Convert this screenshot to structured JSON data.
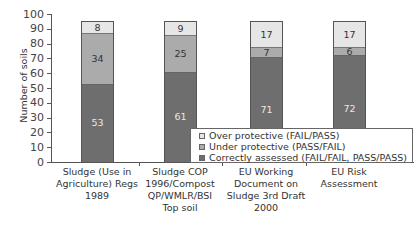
{
  "chart_data": {
    "type": "bar",
    "stacked": true,
    "title": "",
    "xlabel": "",
    "ylabel": "Number of soils",
    "ylim": [
      0,
      100
    ],
    "yticks": [
      0,
      10,
      20,
      30,
      40,
      50,
      60,
      70,
      80,
      90,
      100
    ],
    "grid": false,
    "legend_position": "lower right (inside)",
    "categories": [
      "Sludge (Use in Agriculture) Regs 1989",
      "Sludge COP 1996/Compost QP/WMLR/BSI Top soil",
      "EU Working Document on Sludge 3rd Draft 2000",
      "EU Risk Assessment"
    ],
    "category_lines": [
      [
        "Sludge (Use in",
        "Agriculture) Regs",
        "1989"
      ],
      [
        "Sludge COP",
        "1996/Compost",
        "QP/WMLR/BSI",
        "Top soil"
      ],
      [
        "EU Working",
        "Document on",
        "Sludge 3rd Draft",
        "2000"
      ],
      [
        "EU Risk",
        "Assessment"
      ]
    ],
    "series": [
      {
        "name": "Correctly assessed (FAIL/FAIL, PASS/PASS)",
        "color": "#6e6e6e",
        "values": [
          53,
          61,
          71,
          72
        ]
      },
      {
        "name": "Under protective (PASS/FAIL)",
        "color": "#ababab",
        "values": [
          34,
          25,
          7,
          6
        ]
      },
      {
        "name": "Over protective (FAIL/PASS)",
        "color": "#e6e6e6",
        "values": [
          8,
          9,
          17,
          17
        ]
      }
    ]
  },
  "legend": [
    {
      "label": "Over protective (FAIL/PASS)",
      "color": "#e6e6e6"
    },
    {
      "label": "Under protective (PASS/FAIL)",
      "color": "#ababab"
    },
    {
      "label": "Correctly assessed (FAIL/FAIL, PASS/PASS)",
      "color": "#6e6e6e"
    }
  ]
}
